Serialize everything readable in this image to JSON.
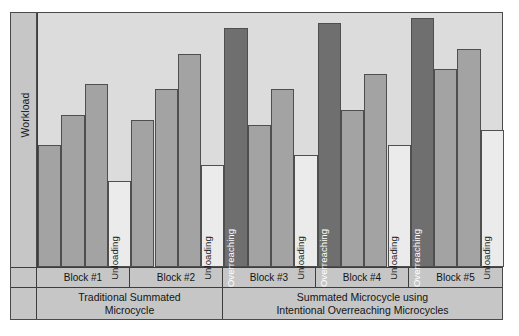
{
  "axis": {
    "ylabel": "Workload"
  },
  "chart_data": {
    "type": "bar",
    "title": "",
    "xlabel": "",
    "ylabel": "Workload",
    "ylim": [
      0,
      100
    ],
    "grid": false,
    "legend": "none",
    "note": "Workload progression across 5 training blocks; bar heights are relative workload units read off the plot area height.",
    "categories": [
      "B1-W1",
      "B1-W2",
      "B1-W3",
      "B1-W4",
      "B2-W1",
      "B2-W2",
      "B2-W3",
      "B2-W4",
      "B3-W1",
      "B3-W2",
      "B3-W3",
      "B3-W4",
      "B4-W1",
      "B4-W2",
      "B4-W3",
      "B4-W4",
      "B5-W1",
      "B5-W2",
      "B5-W3",
      "B5-W4"
    ],
    "values": [
      48,
      60,
      72,
      34,
      58,
      70,
      84,
      40,
      94,
      56,
      70,
      44,
      96,
      62,
      76,
      48,
      98,
      78,
      86,
      54
    ],
    "bar_types": [
      "load",
      "load",
      "load",
      "unload",
      "load",
      "load",
      "load",
      "unload",
      "overreaching",
      "load",
      "load",
      "unload",
      "overreaching",
      "load",
      "load",
      "unload",
      "overreaching",
      "load",
      "load",
      "unload"
    ],
    "bar_labels": [
      "",
      "",
      "",
      "Unloading",
      "",
      "",
      "",
      "Unloading",
      "Overreaching",
      "",
      "",
      "Unloading",
      "Overreaching",
      "",
      "",
      "Unloading",
      "Overreaching",
      "",
      "",
      "Unloading"
    ],
    "colors": {
      "load": "#a3a3a3",
      "unload": "#ebebeb",
      "overreaching": "#6f6f6f",
      "plot_background": "#dcdcdc",
      "panel_background": "#c6c6c6",
      "outline": "#4f4f4f"
    }
  },
  "blocks": [
    {
      "label": "Block #1"
    },
    {
      "label": "Block #2"
    },
    {
      "label": "Block #3"
    },
    {
      "label": "Block #4"
    },
    {
      "label": "Block #5"
    }
  ],
  "phases": [
    {
      "line1": "Traditional Summated",
      "line2": "Microcycle"
    },
    {
      "line1": "Summated Microcycle using",
      "line2": "Intentional Overreaching Microcycles"
    }
  ]
}
